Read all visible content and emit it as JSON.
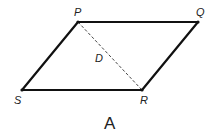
{
  "figure": {
    "caption": "A",
    "vertices": {
      "P": {
        "label": "P",
        "x": 78,
        "y": 22
      },
      "Q": {
        "label": "Q",
        "x": 198,
        "y": 22
      },
      "R": {
        "label": "R",
        "x": 142,
        "y": 90
      },
      "S": {
        "label": "S",
        "x": 22,
        "y": 90
      }
    },
    "diagonal": {
      "from": "P",
      "to": "R",
      "style": "dashed"
    },
    "intersection_label": "D"
  }
}
